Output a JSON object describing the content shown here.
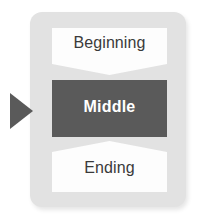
{
  "diagram": {
    "panel": {
      "background_color": "#e2e2e2"
    },
    "pointer": {
      "icon": "triangle-right-icon",
      "color": "#5a5a5a"
    },
    "steps": [
      {
        "id": "beginning",
        "label": "Beginning",
        "shape": "chevron-banner-down",
        "fill_color": "#fdfdfd",
        "text_color": "#3a3a3a",
        "emphasis": "normal"
      },
      {
        "id": "middle",
        "label": "Middle",
        "shape": "rectangle",
        "fill_color": "#5a5a5a",
        "text_color": "#ffffff",
        "emphasis": "bold"
      },
      {
        "id": "ending",
        "label": "Ending",
        "shape": "chevron-banner-up",
        "fill_color": "#fdfdfd",
        "text_color": "#3a3a3a",
        "emphasis": "normal"
      }
    ]
  }
}
